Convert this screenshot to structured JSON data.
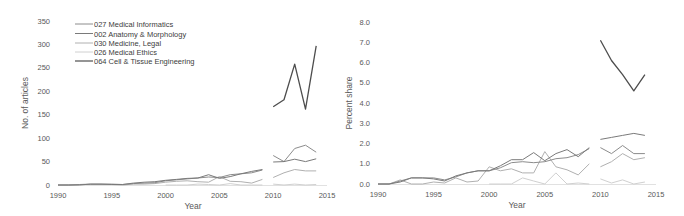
{
  "chart_data": [
    {
      "type": "line",
      "title": "",
      "xlabel": "Year",
      "ylabel": "No. of articles",
      "xlim": [
        1990,
        2015
      ],
      "ylim": [
        0,
        350
      ],
      "x_ticks": [
        1990,
        1995,
        2000,
        2005,
        2010,
        2015
      ],
      "y_ticks": [
        0,
        50,
        100,
        150,
        200,
        250,
        300,
        350
      ],
      "grid": false,
      "legend_position": "upper-left",
      "x": [
        1990,
        1991,
        1992,
        1993,
        1994,
        1995,
        1996,
        1997,
        1998,
        1999,
        2000,
        2001,
        2002,
        2003,
        2004,
        2005,
        2006,
        2007,
        2008,
        2009,
        2010,
        2011,
        2012,
        2013,
        2014
      ],
      "series": [
        {
          "name": "027 Medical Informatics",
          "color": "#8c8c8c",
          "values": [
            0,
            0,
            1,
            2,
            2,
            2,
            1,
            3,
            4,
            5,
            9,
            11,
            13,
            15,
            17,
            16,
            22,
            24,
            26,
            32,
            63,
            50,
            78,
            85,
            70
          ]
        },
        {
          "name": "002 Anatomy & Morphology",
          "color": "#7a7a7a",
          "values": [
            0,
            0,
            0,
            2,
            2,
            1,
            1,
            4,
            6,
            7,
            10,
            12,
            14,
            15,
            22,
            14,
            18,
            24,
            29,
            33,
            49,
            50,
            55,
            50,
            56
          ]
        },
        {
          "name": "030 Medicine, Legal",
          "color": "#b0b0b0",
          "values": [
            0,
            0,
            1,
            1,
            1,
            1,
            0,
            2,
            2,
            3,
            6,
            8,
            9,
            7,
            6,
            18,
            8,
            7,
            4,
            12,
            16,
            26,
            33,
            30,
            30
          ]
        },
        {
          "name": "026 Medical Ethics",
          "color": "#d0d0d0",
          "values": [
            null,
            null,
            null,
            null,
            null,
            null,
            null,
            null,
            null,
            null,
            0,
            0,
            0,
            2,
            1,
            0,
            3,
            0,
            0,
            0,
            2,
            0,
            2,
            0,
            1
          ]
        },
        {
          "name": "064 Cell & Tissue Engineering",
          "color": "#4d4d4d",
          "values": [
            null,
            null,
            null,
            null,
            null,
            null,
            null,
            null,
            null,
            null,
            null,
            null,
            null,
            null,
            null,
            null,
            null,
            null,
            null,
            null,
            167,
            182,
            258,
            162,
            297
          ]
        }
      ],
      "gap_after": 2009
    },
    {
      "type": "line",
      "title": "",
      "xlabel": "Year",
      "ylabel": "Percent share",
      "xlim": [
        1990,
        2015
      ],
      "ylim": [
        0,
        8
      ],
      "x_ticks": [
        1990,
        1995,
        2000,
        2005,
        2010,
        2015
      ],
      "y_ticks": [
        "0.0",
        "1.0",
        "2.0",
        "3.0",
        "4.0",
        "5.0",
        "6.0",
        "7.0",
        "8.0"
      ],
      "grid": false,
      "x": [
        1990,
        1991,
        1992,
        1993,
        1994,
        1995,
        1996,
        1997,
        1998,
        1999,
        2000,
        2001,
        2002,
        2003,
        2004,
        2005,
        2006,
        2007,
        2008,
        2009,
        2010,
        2011,
        2012,
        2013,
        2014
      ],
      "series": [
        {
          "name": "027 Medical Informatics",
          "color": "#8c8c8c",
          "values": [
            0,
            0,
            0.15,
            0.3,
            0.3,
            0.3,
            0.2,
            0.35,
            0.55,
            0.65,
            0.65,
            0.8,
            1.05,
            1.1,
            1.05,
            1.1,
            1.25,
            1.3,
            1.45,
            1.75,
            1.8,
            1.5,
            1.9,
            1.5,
            1.5
          ]
        },
        {
          "name": "002 Anatomy & Morphology",
          "color": "#7a7a7a",
          "values": [
            0,
            0,
            0.1,
            0.3,
            0.3,
            0.25,
            0.15,
            0.4,
            0.55,
            0.65,
            0.65,
            0.9,
            1.2,
            1.2,
            1.55,
            1.15,
            1.5,
            1.7,
            1.35,
            1.8,
            2.2,
            2.3,
            2.4,
            2.5,
            2.4
          ]
        },
        {
          "name": "030 Medicine, Legal",
          "color": "#b0b0b0",
          "values": [
            0,
            0,
            0.2,
            0,
            0,
            0.1,
            0.05,
            0.3,
            0.1,
            0.15,
            0.85,
            0.65,
            0.75,
            0.55,
            0.55,
            1.6,
            0.85,
            0.7,
            0.45,
            1.0,
            0.85,
            1.1,
            1.5,
            1.2,
            1.3
          ]
        },
        {
          "name": "026 Medical Ethics",
          "color": "#d0d0d0",
          "values": [
            null,
            null,
            null,
            null,
            null,
            null,
            null,
            null,
            null,
            null,
            0,
            0,
            0,
            0.3,
            0.15,
            0,
            0.55,
            0,
            0.05,
            0,
            0.25,
            0.05,
            0.2,
            0.0,
            0.1
          ]
        },
        {
          "name": "064 Cell & Tissue Engineering",
          "color": "#4d4d4d",
          "values": [
            null,
            null,
            null,
            null,
            null,
            null,
            null,
            null,
            null,
            null,
            null,
            null,
            null,
            null,
            null,
            null,
            null,
            null,
            null,
            null,
            7.1,
            6.1,
            5.4,
            4.6,
            5.4
          ]
        }
      ],
      "gap_after": 2009
    }
  ],
  "left_chart": {
    "ylabel": "No. of articles",
    "xlabel": "Year",
    "y_ticks": [
      "0",
      "50",
      "100",
      "150",
      "200",
      "250",
      "300",
      "350"
    ],
    "x_ticks": [
      "1990",
      "1995",
      "2000",
      "2005",
      "2010",
      "2015"
    ],
    "legend": [
      "027 Medical Informatics",
      "002 Anatomy & Morphology",
      "030 Medicine, Legal",
      "026 Medical Ethics",
      "064 Cell & Tissue Engineering"
    ]
  },
  "right_chart": {
    "ylabel": "Percent share",
    "xlabel": "Year",
    "y_ticks": [
      "0.0",
      "1.0",
      "2.0",
      "3.0",
      "4.0",
      "5.0",
      "6.0",
      "7.0",
      "8.0"
    ],
    "x_ticks": [
      "1990",
      "1995",
      "2000",
      "2005",
      "2010",
      "2015"
    ]
  }
}
